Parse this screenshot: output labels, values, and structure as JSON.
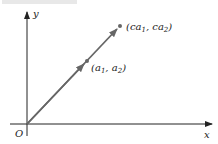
{
  "diagram": {
    "axes": {
      "origin_label": "O",
      "x_label": "x",
      "y_label": "y"
    },
    "points": [
      {
        "id": "a",
        "label": "(a",
        "sub1": "1",
        "mid": ", a",
        "sub2": "2",
        "close": ")"
      },
      {
        "id": "ca",
        "label": "(ca",
        "sub1": "1",
        "mid": ", ca",
        "sub2": "2",
        "close": ")"
      }
    ],
    "colors": {
      "axis": "#222222",
      "vector": "#666666",
      "point": "#666666"
    }
  }
}
